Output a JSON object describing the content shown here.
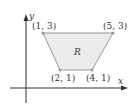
{
  "diagram": {
    "axes": {
      "x_label": "x",
      "y_label": "y"
    },
    "region": {
      "label": "R",
      "fill": "#ececec",
      "stroke": "#9a9a9a"
    },
    "vertices": [
      {
        "label": "(1, 3)",
        "x": 1,
        "y": 3
      },
      {
        "label": "(5, 3)",
        "x": 5,
        "y": 3
      },
      {
        "label": "(2, 1)",
        "x": 2,
        "y": 1
      },
      {
        "label": "(4, 1)",
        "x": 4,
        "y": 1
      }
    ],
    "colors": {
      "axis": "#333333",
      "point": "#9a9a9a",
      "text": "#333333"
    }
  }
}
